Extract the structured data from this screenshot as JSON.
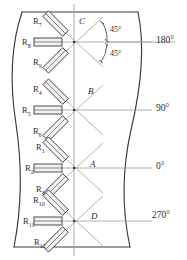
{
  "figure": {
    "type": "engineering-diagram",
    "stroke_color": "#3a3a3a",
    "thin_line_color": "#8a8a8a",
    "gauge_fill": "#f2f2f2",
    "text_color": "#2b2b2b"
  },
  "angle_annotations": [
    {
      "id": "upper",
      "text": "45°"
    },
    {
      "id": "lower",
      "text": "45°"
    }
  ],
  "axis_labels": [
    {
      "id": "pos-180",
      "text": "180°"
    },
    {
      "id": "pos-90",
      "text": "90°"
    },
    {
      "id": "pos-0",
      "text": "0°"
    },
    {
      "id": "pos-270",
      "text": "270°"
    }
  ],
  "rosettes": [
    {
      "id": "C",
      "point_label": "C",
      "position_deg": "180°",
      "center": {
        "x": 74,
        "y": 42
      },
      "gauges": [
        {
          "name": "R",
          "sub": "7",
          "orientation": "plus45"
        },
        {
          "name": "R",
          "sub": "8",
          "orientation": "horizontal"
        },
        {
          "name": "R",
          "sub": "9",
          "orientation": "minus45"
        }
      ]
    },
    {
      "id": "B",
      "point_label": "B",
      "position_deg": "90°",
      "center": {
        "x": 74,
        "y": 110
      },
      "gauges": [
        {
          "name": "R",
          "sub": "4",
          "orientation": "plus45"
        },
        {
          "name": "R",
          "sub": "5",
          "orientation": "horizontal"
        },
        {
          "name": "R",
          "sub": "6",
          "orientation": "minus45"
        }
      ]
    },
    {
      "id": "A",
      "point_label": "A",
      "position_deg": "0°",
      "center": {
        "x": 74,
        "y": 168
      },
      "gauges": [
        {
          "name": "R",
          "sub": "1",
          "orientation": "plus45"
        },
        {
          "name": "R",
          "sub": "2",
          "orientation": "horizontal"
        },
        {
          "name": "R",
          "sub": "3",
          "orientation": "minus45"
        }
      ]
    },
    {
      "id": "D",
      "point_label": "D",
      "position_deg": "270°",
      "center": {
        "x": 74,
        "y": 221
      },
      "gauges": [
        {
          "name": "R",
          "sub": "10",
          "orientation": "plus45"
        },
        {
          "name": "R",
          "sub": "11",
          "orientation": "horizontal"
        },
        {
          "name": "R",
          "sub": "12",
          "orientation": "minus45"
        }
      ]
    }
  ]
}
